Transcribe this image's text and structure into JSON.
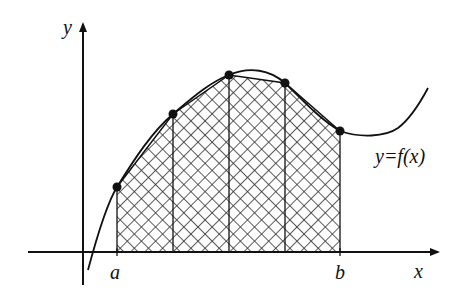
{
  "diagram": {
    "labels": {
      "y_axis": "y",
      "x_axis": "x",
      "a": "a",
      "b": "b",
      "function": "y=f(x)"
    },
    "points": [
      {
        "x": 117,
        "y": 187
      },
      {
        "x": 173,
        "y": 114
      },
      {
        "x": 229,
        "y": 75
      },
      {
        "x": 285,
        "y": 83
      },
      {
        "x": 340,
        "y": 131
      }
    ],
    "subintervals": 4,
    "fill_pattern": "cross-hatch",
    "colors": {
      "ink": "#111111",
      "background": "#ffffff"
    }
  }
}
